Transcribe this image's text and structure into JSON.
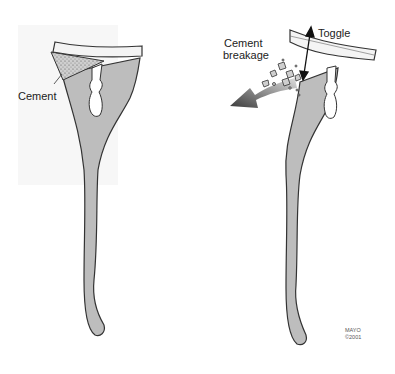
{
  "figure": {
    "left_panel": {
      "label_cement": "Cement"
    },
    "right_panel": {
      "label_toggle": "Toggle",
      "label_breakage_line1": "Cement",
      "label_breakage_line2": "breakage"
    },
    "credit_line1": "MAYO",
    "credit_line2": "©2001"
  },
  "colors": {
    "bone": "#bdbdbd",
    "outline": "#333333",
    "tray": "#f4f4f4",
    "arrow_dark": "#444444"
  }
}
